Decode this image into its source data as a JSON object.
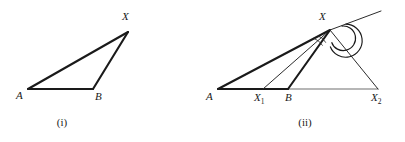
{
  "figure": {
    "width": 405,
    "height": 142,
    "background": "#ffffff",
    "ink_color": "#1a1a1a",
    "base_color": "#6e6e6e"
  },
  "panels": [
    {
      "id": "panel-i",
      "caption": "(i)",
      "caption_pos": {
        "x": 62,
        "y": 126
      },
      "description": "Triangle A B X",
      "points": [
        {
          "name": "A",
          "label": "A",
          "sub": "",
          "x": 28,
          "y": 89,
          "label_x": 16,
          "label_y": 99
        },
        {
          "name": "B",
          "label": "B",
          "sub": "",
          "x": 93,
          "y": 89,
          "label_x": 95,
          "label_y": 100
        },
        {
          "name": "X",
          "label": "X",
          "sub": "",
          "x": 128,
          "y": 32,
          "label_x": 122,
          "label_y": 20
        }
      ],
      "segments": [
        {
          "name": "segment-A-B",
          "from": "A",
          "to": "B",
          "weight": "bold"
        },
        {
          "name": "segment-A-X",
          "from": "A",
          "to": "X",
          "weight": "bold"
        },
        {
          "name": "segment-B-X",
          "from": "B",
          "to": "X",
          "weight": "bold"
        }
      ]
    },
    {
      "id": "panel-ii",
      "caption": "(ii)",
      "caption_pos": {
        "x": 305,
        "y": 126
      },
      "description": "Triangle A B X with cevians to X1 and X2 and a ray beyond X",
      "points": [
        {
          "name": "A",
          "label": "A",
          "sub": "",
          "x": 218,
          "y": 89,
          "label_x": 206,
          "label_y": 100
        },
        {
          "name": "X1",
          "label": "X",
          "sub": "1",
          "x": 263,
          "y": 89,
          "label_x": 254,
          "label_y": 101
        },
        {
          "name": "B",
          "label": "B",
          "sub": "",
          "x": 288,
          "y": 89,
          "label_x": 285,
          "label_y": 101
        },
        {
          "name": "X2",
          "label": "X",
          "sub": "2",
          "x": 378,
          "y": 89,
          "label_x": 371,
          "label_y": 101
        },
        {
          "name": "X",
          "label": "X",
          "sub": "",
          "x": 330,
          "y": 30,
          "label_x": 319,
          "label_y": 20
        },
        {
          "name": "RayEnd",
          "label": "",
          "sub": "",
          "x": 381,
          "y": 11,
          "label_x": 0,
          "label_y": 0
        }
      ],
      "segments": [
        {
          "name": "segment-A-X2-base",
          "from": "A",
          "to": "X2",
          "weight": "base"
        },
        {
          "name": "segment-A-B-base-bold",
          "from": "A",
          "to": "B",
          "weight": "bold"
        },
        {
          "name": "segment-A-X",
          "from": "A",
          "to": "X",
          "weight": "bold"
        },
        {
          "name": "segment-X1-X",
          "from": "X1",
          "to": "X",
          "weight": "thin"
        },
        {
          "name": "segment-B-X",
          "from": "B",
          "to": "X",
          "weight": "bold"
        },
        {
          "name": "segment-X2-X",
          "from": "X2",
          "to": "X",
          "weight": "thin"
        },
        {
          "name": "ray-beyond-X",
          "from": "X",
          "to": "RayEnd",
          "weight": "thin"
        }
      ],
      "angle_marks": [
        {
          "name": "angle-arc-large-at-X",
          "type": "large-circle-arc"
        },
        {
          "name": "angle-arc-medium-at-X",
          "type": "medium-arc"
        },
        {
          "name": "angle-arc-small-at-X",
          "type": "small-arc"
        },
        {
          "name": "angle-arc-tiny-at-X",
          "type": "tiny-arc"
        }
      ]
    }
  ]
}
